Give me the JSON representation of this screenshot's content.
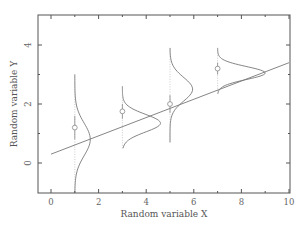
{
  "chart_data": {
    "type": "scatter",
    "title": "",
    "xlabel": "Random variable X",
    "ylabel": "Random variable Y",
    "xlim": [
      -0.55,
      10
    ],
    "ylim": [
      -1.0,
      5.0
    ],
    "xticks": [
      0,
      2,
      4,
      6,
      8,
      10
    ],
    "xminor": [
      1,
      3,
      5,
      7,
      9
    ],
    "yticks": [
      0,
      2,
      4
    ],
    "yminor": [
      1,
      3
    ],
    "grid": false,
    "points": [
      {
        "x": 1,
        "y": 1.2,
        "err": 0.4
      },
      {
        "x": 3,
        "y": 1.75,
        "err": 0.25
      },
      {
        "x": 5,
        "y": 2.0,
        "err": 0.3
      },
      {
        "x": 7,
        "y": 3.2,
        "err": 0.2
      }
    ],
    "regression_line": {
      "intercept": 0.3,
      "slope": 0.31,
      "x_range": [
        0,
        10
      ]
    },
    "conditional_densities": [
      {
        "x": 1,
        "mean": 0.8,
        "sd": 0.55,
        "y_range": [
          -1.0,
          3.0
        ],
        "height": 0.65
      },
      {
        "x": 3,
        "mean": 1.35,
        "sd": 0.3,
        "y_range": [
          0.5,
          2.6
        ],
        "height": 1.6
      },
      {
        "x": 5,
        "mean": 2.5,
        "sd": 0.4,
        "y_range": [
          0.7,
          3.9
        ],
        "height": 0.95
      },
      {
        "x": 7,
        "mean": 3.05,
        "sd": 0.22,
        "y_range": [
          2.35,
          3.9
        ],
        "height": 2.0
      }
    ]
  },
  "colors": {
    "frame": "#555555",
    "line": "#777777",
    "density": "#777777",
    "errorbar": "#aaaaaa",
    "point": "#888888"
  }
}
